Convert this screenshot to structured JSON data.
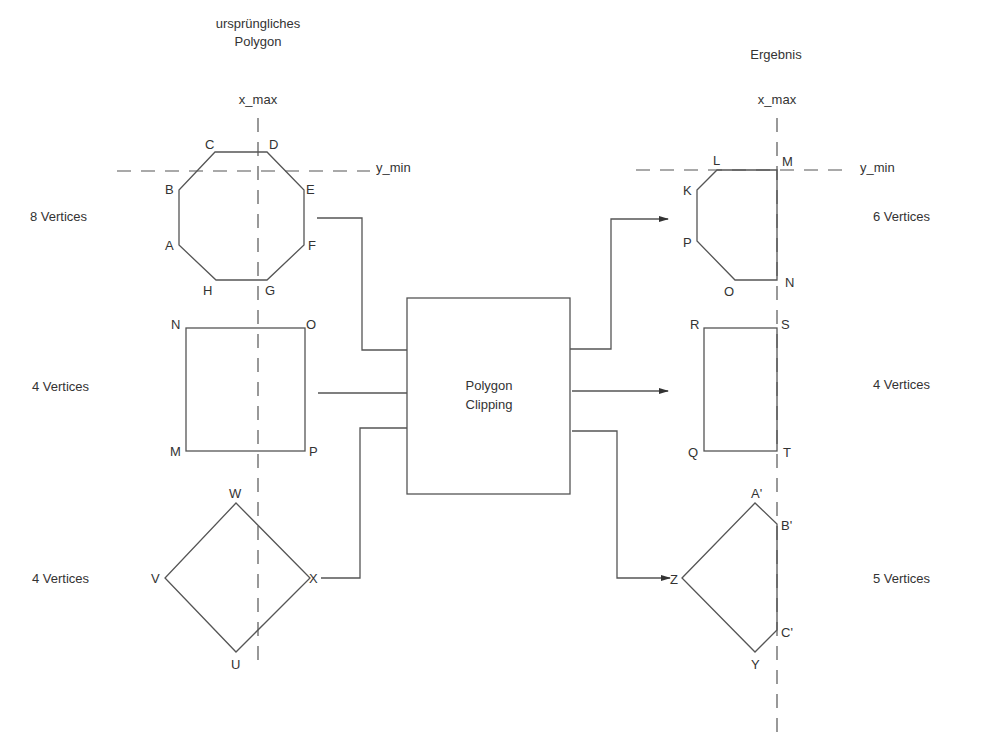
{
  "titles": {
    "original_line1": "ursprüngliches",
    "original_line2": "Polygon",
    "result": "Ergebnis"
  },
  "clip_labels": {
    "x_max_left": "x_max",
    "x_max_right": "x_max",
    "y_min_left": "y_min",
    "y_min_right": "y_min"
  },
  "process_box": {
    "line1": "Polygon",
    "line2": "Clipping"
  },
  "inputs": [
    {
      "vertex_count": "8 Vertices",
      "vertices": [
        "A",
        "B",
        "C",
        "D",
        "E",
        "F",
        "G",
        "H"
      ]
    },
    {
      "vertex_count": "4 Vertices",
      "vertices": [
        "M",
        "N",
        "O",
        "P"
      ]
    },
    {
      "vertex_count": "4 Vertices",
      "vertices": [
        "U",
        "V",
        "W",
        "X"
      ]
    }
  ],
  "outputs": [
    {
      "vertex_count": "6 Vertices",
      "vertices": [
        "K",
        "L",
        "M",
        "N",
        "O",
        "P"
      ]
    },
    {
      "vertex_count": "4 Vertices",
      "vertices": [
        "Q",
        "R",
        "S",
        "T"
      ]
    },
    {
      "vertex_count": "5 Vertices",
      "vertices": [
        "Z",
        "A'",
        "B'",
        "C'",
        "Y"
      ]
    }
  ]
}
